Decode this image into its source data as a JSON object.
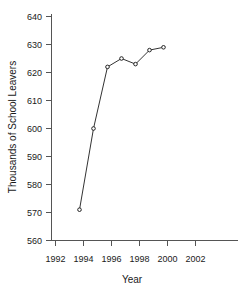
{
  "chart_data": {
    "type": "line",
    "title": "",
    "xlabel": "Year",
    "ylabel": "Thousands of School Leavers",
    "x": [
      1994,
      1995,
      1996,
      1997,
      1998,
      1999,
      2000
    ],
    "values": [
      571,
      600,
      622,
      625,
      623,
      628,
      629
    ],
    "series": [
      {
        "name": "School Leavers",
        "values": [
          571,
          600,
          622,
          625,
          623,
          628,
          629
        ]
      }
    ],
    "xlim": [
      1992,
      2003
    ],
    "ylim": [
      560,
      640
    ],
    "xticks": [
      1992,
      1994,
      1996,
      1998,
      2000,
      2002
    ],
    "xtick_labels": [
      "1992",
      "1994",
      "1996",
      "1998",
      "2000",
      "2002"
    ],
    "yticks": [
      560,
      570,
      580,
      590,
      600,
      610,
      620,
      630,
      640
    ],
    "ytick_labels": [
      "560",
      "570",
      "580",
      "590",
      "600",
      "610",
      "620",
      "630",
      "640"
    ],
    "grid": false,
    "legend": false,
    "legend_position": "none",
    "marker": "open-circle",
    "line_color": "#333333",
    "marker_color": "#222222",
    "axis_color": "#555555",
    "background_color": "#ffffff"
  }
}
